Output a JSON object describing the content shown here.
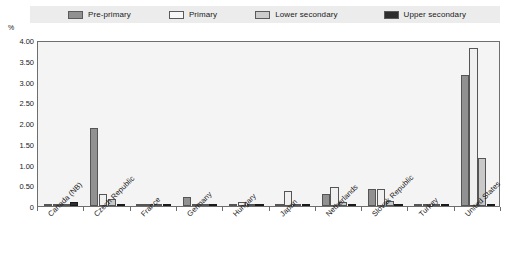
{
  "chart_data": {
    "type": "bar",
    "title": "",
    "subtitle": "",
    "xlabel": "",
    "ylabel": "%",
    "ylim": [
      0,
      4.0
    ],
    "grid": false,
    "legend_position": "top",
    "ytick_labels": [
      "4.00",
      "3.50",
      "3.00",
      "2.50",
      "2.00",
      "1.50",
      "1.00",
      "0.50",
      "0"
    ],
    "ytick_values": [
      4.0,
      3.5,
      3.0,
      2.5,
      2.0,
      1.5,
      1.0,
      0.5,
      0
    ],
    "categories": [
      "Canada (NB)",
      "Czech Republic",
      "France",
      "Germany",
      "Hungary",
      "Japan",
      "Netherlands",
      "Slovak Republic",
      "Turkey",
      "United States"
    ],
    "series": [
      {
        "name": "Pre-primary",
        "color": "#919191",
        "values": [
          0.05,
          1.88,
          0.02,
          0.22,
          0.06,
          0.04,
          0.28,
          0.4,
          0.03,
          3.15
        ]
      },
      {
        "name": "Primary",
        "color": "#f0f0f0",
        "values": [
          0.06,
          0.28,
          0.02,
          0.03,
          0.09,
          0.35,
          0.47,
          0.42,
          0.04,
          3.8
        ]
      },
      {
        "name": "Lower secondary",
        "color": "#c9c9c9",
        "values": [
          0.04,
          0.17,
          0.02,
          0.02,
          0.06,
          0.03,
          0.1,
          0.12,
          0.03,
          1.15
        ]
      },
      {
        "name": "Upper secondary",
        "color": "#2e2e2e",
        "values": [
          0.1,
          0.01,
          0.01,
          0.01,
          0.01,
          0.01,
          0.01,
          0.01,
          0.02,
          0.05
        ]
      }
    ]
  },
  "legend": {
    "items": [
      {
        "label": "Pre-primary",
        "color": "#919191"
      },
      {
        "label": "Primary",
        "color": "#f5f5f5"
      },
      {
        "label": "Lower secondary",
        "color": "#cccccc"
      },
      {
        "label": "Upper secondary",
        "color": "#2e2e2e"
      }
    ]
  },
  "axis": {
    "y_unit": "%"
  }
}
